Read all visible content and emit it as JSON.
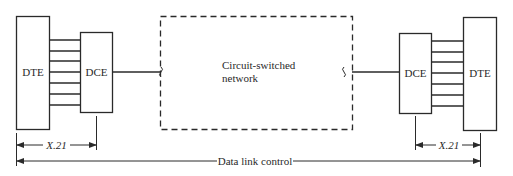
{
  "diagram": {
    "left": {
      "dte_label": "DTE",
      "dce_label": "DCE",
      "interface_label": "X.21"
    },
    "network": {
      "label_line1": "Circuit-switched",
      "label_line2": "network"
    },
    "right": {
      "dce_label": "DCE",
      "dte_label": "DTE",
      "interface_label": "X.21"
    },
    "span_label": "Data link control",
    "wire_count": 7,
    "colors": {
      "stroke": "#2a2a2a",
      "background": "#ffffff"
    }
  }
}
